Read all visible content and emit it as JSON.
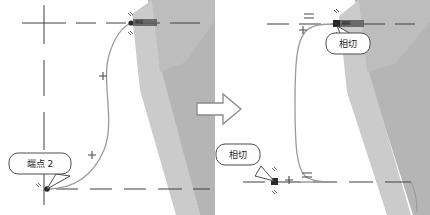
{
  "figure": {
    "type": "cad-sketch-comparison"
  },
  "transition": {
    "arrow_icon": "right-arrow-icon",
    "direction": "right",
    "outline_color": "#8a8a8a",
    "fill_color": "#ffffff"
  },
  "colors": {
    "centerline": "#3f3f3f",
    "spline": "#9a9a9a",
    "marker": "#4a4a4a",
    "shade_dark": "#b5b5b5",
    "shade_light": "#cccccc",
    "shade_mid": "#c2c2c2",
    "callout_border": "#4d4d4d",
    "callout_fill": "#ffffff",
    "text": "#1a1a1a"
  },
  "left_panel": {
    "name": "before-state",
    "callouts": [
      {
        "id": "endpoint-callout",
        "label": "端点 2",
        "x": 40,
        "y": 163,
        "width": 62,
        "height": 21,
        "tail_to_x": 47,
        "tail_to_y": 189
      }
    ],
    "relation_tags": [
      {
        "id": "top-relation-tag",
        "label": "相切",
        "x": 133,
        "y": 23
      }
    ],
    "markers": [
      {
        "type": "plus",
        "x": 44,
        "y": 23
      },
      {
        "type": "plus",
        "x": 103,
        "y": 76
      },
      {
        "type": "plus",
        "x": 92,
        "y": 155
      },
      {
        "type": "dot",
        "x": 131,
        "y": 23
      },
      {
        "type": "dot",
        "x": 47,
        "y": 189
      }
    ],
    "centerlines": [
      {
        "orientation": "horizontal",
        "y": 23
      },
      {
        "orientation": "horizontal",
        "y": 189
      },
      {
        "orientation": "vertical",
        "x": 44
      }
    ]
  },
  "right_panel": {
    "name": "after-state",
    "callouts": [
      {
        "id": "tangent-callout-top",
        "label": "相切",
        "x": 133,
        "y": 40,
        "width": 44,
        "height": 21,
        "tail_to_x": 122,
        "tail_to_y": 26
      },
      {
        "id": "tangent-callout-bottom",
        "label": "相切",
        "x": 22,
        "y": 151,
        "width": 44,
        "height": 21,
        "tail_to_x": 59,
        "tail_to_y": 181
      }
    ],
    "relation_tags": [
      {
        "id": "top-relation-tag",
        "label": "相切",
        "x": 124,
        "y": 23
      }
    ],
    "markers": [
      {
        "type": "plus",
        "x": 88,
        "y": 30
      },
      {
        "type": "plus",
        "x": 74,
        "y": 180
      },
      {
        "type": "equal",
        "x": 94,
        "y": 16
      },
      {
        "type": "equal",
        "x": 92,
        "y": 175
      },
      {
        "type": "square",
        "x": 122,
        "y": 24
      },
      {
        "type": "square",
        "x": 60,
        "y": 182
      }
    ],
    "centerlines": [
      {
        "orientation": "horizontal",
        "y": 24
      },
      {
        "orientation": "horizontal",
        "y": 182
      }
    ]
  }
}
